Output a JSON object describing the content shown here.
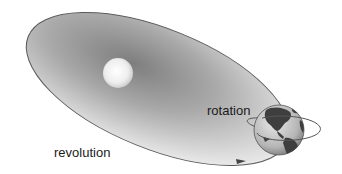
{
  "diagram": {
    "labels": {
      "rotation": "rotation",
      "revolution": "revolution"
    },
    "elements": {
      "sun": "sun",
      "earth": "earth",
      "orbit": "elliptical-orbit",
      "rotation_arrow": "rotation-arrow",
      "revolution_arrow": "revolution-arrow"
    },
    "colors": {
      "orbit_line": "#555555",
      "orbit_fill_center": "#8a8a8a",
      "orbit_fill_edge": "#e6e6e6",
      "sun": "#f4f4f4",
      "earth_ocean": "#c9c9c9",
      "earth_land": "#4a4a4a"
    }
  }
}
